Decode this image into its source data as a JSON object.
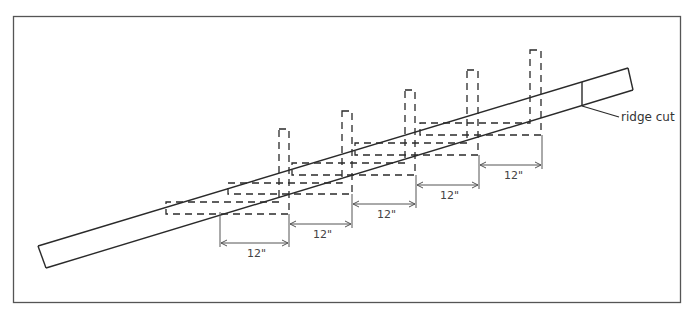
{
  "diagram": {
    "labels": {
      "ridge_cut": "ridge cut"
    },
    "dimensions": [
      {
        "label": "12\"",
        "x1": 220,
        "x2": 289,
        "y": 243
      },
      {
        "label": "12\"",
        "x1": 289,
        "x2": 352,
        "y": 224
      },
      {
        "label": "12\"",
        "x1": 352,
        "x2": 416,
        "y": 204
      },
      {
        "label": "12\"",
        "x1": 416,
        "x2": 479,
        "y": 185
      },
      {
        "label": "12\"",
        "x1": 479,
        "x2": 542,
        "y": 165
      }
    ],
    "squares_count": 5,
    "colors": {
      "line": "#2a2a2a",
      "frame": "#555555",
      "dim": "#555555",
      "background": "#ffffff"
    }
  }
}
